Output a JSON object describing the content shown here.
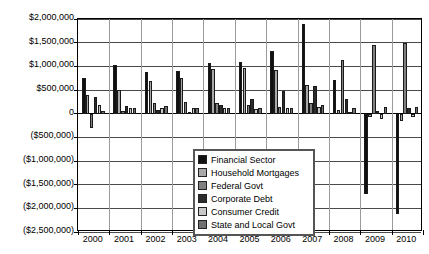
{
  "chart_data": {
    "type": "bar",
    "title": "",
    "subtitle": "",
    "xlabel": "",
    "ylabel": "",
    "grid": true,
    "legend_position": "inside-bottom-left",
    "categories": [
      "2000",
      "2001",
      "2002",
      "2003",
      "2004",
      "2005",
      "2006",
      "2007",
      "2008",
      "2009",
      "2010"
    ],
    "ylim": [
      -2500000,
      2000000
    ],
    "ytick_values": [
      2000000,
      1500000,
      1000000,
      500000,
      0,
      -500000,
      -1000000,
      -1500000,
      -2000000,
      -2500000
    ],
    "ytick_labels": [
      "$2,000,000",
      "$1,500,000",
      "$1,000,000",
      "$500,000",
      "0",
      "($500,000)",
      "($1,000,000)",
      "($1,500,000)",
      "($2,000,000)",
      "($2,500,000)"
    ],
    "series": [
      {
        "name": "Financial Sector",
        "color": "#101010",
        "values": [
          760000,
          1020000,
          880000,
          900000,
          1080000,
          1090000,
          1320000,
          1900000,
          710000,
          -1690000,
          -2120000
        ]
      },
      {
        "name": "Household Mortgages",
        "color": "#a8a8a8",
        "values": [
          390000,
          500000,
          690000,
          750000,
          940000,
          960000,
          920000,
          600000,
          70000,
          -70000,
          -160000
        ]
      },
      {
        "name": "Federal Govt",
        "color": "#808080",
        "values": [
          -300000,
          60000,
          230000,
          250000,
          220000,
          180000,
          150000,
          230000,
          1140000,
          1450000,
          1500000
        ]
      },
      {
        "name": "Corporate Debt",
        "color": "#2b2b2b",
        "values": [
          360000,
          160000,
          80000,
          40000,
          180000,
          310000,
          470000,
          590000,
          300000,
          60000,
          130000
        ]
      },
      {
        "name": "Consumer Credit",
        "color": "#c8c8c8",
        "values": [
          190000,
          120000,
          110000,
          110000,
          110000,
          100000,
          110000,
          140000,
          40000,
          -110000,
          -80000
        ]
      },
      {
        "name": "State and Local Govt",
        "color": "#707070",
        "values": [
          60000,
          120000,
          170000,
          130000,
          110000,
          120000,
          130000,
          180000,
          130000,
          140000,
          150000
        ]
      }
    ]
  }
}
